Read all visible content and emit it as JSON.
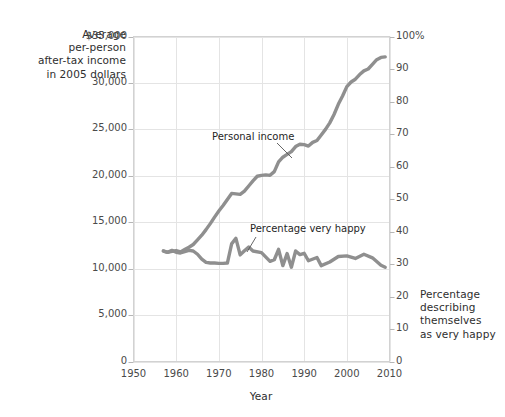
{
  "chart_data": {
    "type": "line",
    "title": "",
    "xlabel": "Year",
    "ylabel_left": "Average per-person after-tax income in 2005 dollars",
    "ylabel_right": "Percentage describing themselves as very happy",
    "xlim": [
      1950,
      2010
    ],
    "ylim_left": [
      0,
      35000
    ],
    "ylim_right": [
      0,
      100
    ],
    "grid": true,
    "legend": "annotations",
    "x_ticks": [
      "1950",
      "1960",
      "1970",
      "1980",
      "1990",
      "2000",
      "2010"
    ],
    "y_ticks_left": [
      "$35,000",
      "30,000",
      "25,000",
      "20,000",
      "15,000",
      "10,000",
      "5,000",
      "0"
    ],
    "y_ticks_right": [
      "100%",
      "90",
      "80",
      "70",
      "60",
      "50",
      "40",
      "30",
      "20",
      "10",
      "0"
    ],
    "series": [
      {
        "name": "Personal income",
        "axis": "left",
        "units": "2005 dollars",
        "color": "#8f8f8f",
        "x": [
          1957,
          1958,
          1959,
          1960,
          1961,
          1962,
          1963,
          1964,
          1965,
          1966,
          1967,
          1968,
          1969,
          1970,
          1971,
          1972,
          1973,
          1974,
          1975,
          1976,
          1977,
          1978,
          1979,
          1980,
          1981,
          1982,
          1983,
          1984,
          1985,
          1986,
          1987,
          1988,
          1989,
          1990,
          1991,
          1992,
          1993,
          1994,
          1995,
          1996,
          1997,
          1998,
          1999,
          2000,
          2001,
          2002,
          2003,
          2004,
          2005,
          2006,
          2007,
          2008,
          2009
        ],
        "values": [
          11900,
          11750,
          11850,
          11950,
          11800,
          12050,
          12300,
          12600,
          13100,
          13600,
          14200,
          14850,
          15550,
          16200,
          16800,
          17450,
          18100,
          18050,
          18000,
          18350,
          18900,
          19450,
          19950,
          20050,
          20100,
          20050,
          20450,
          21500,
          22000,
          22300,
          22600,
          23150,
          23400,
          23350,
          23200,
          23600,
          23800,
          24400,
          25000,
          25700,
          26600,
          27700,
          28600,
          29600,
          30100,
          30400,
          30900,
          31300,
          31500,
          32000,
          32500,
          32750,
          32800
        ]
      },
      {
        "name": "Percentage very happy",
        "axis": "right",
        "units": "percent",
        "color": "#8f8f8f",
        "x": [
          1957,
          1958,
          1959,
          1960,
          1961,
          1962,
          1963,
          1964,
          1965,
          1966,
          1967,
          1968,
          1969,
          1970,
          1971,
          1972,
          1973,
          1974,
          1975,
          1976,
          1977,
          1978,
          1980,
          1982,
          1983,
          1984,
          1985,
          1986,
          1987,
          1988,
          1989,
          1990,
          1991,
          1993,
          1994,
          1996,
          1998,
          2000,
          2002,
          2004,
          2006,
          2008,
          2009
        ],
        "values": [
          34.0,
          33.6,
          34.2,
          33.6,
          33.4,
          33.8,
          34.2,
          34.0,
          33.0,
          31.5,
          30.5,
          30.3,
          30.3,
          30.2,
          30.2,
          30.3,
          36.2,
          37.9,
          32.8,
          34.1,
          35.2,
          34.0,
          33.5,
          30.8,
          31.3,
          34.5,
          29.5,
          33.2,
          29.0,
          34.0,
          32.9,
          33.3,
          31.0,
          32.0,
          29.5,
          30.6,
          32.3,
          32.5,
          31.7,
          33.0,
          31.9,
          29.6,
          29.0
        ]
      }
    ],
    "annotations": [
      {
        "text": "Personal income",
        "x": 1980,
        "y": 22300
      },
      {
        "text": "Percentage very happy",
        "x": 1988,
        "y": 41
      }
    ]
  },
  "axes": {
    "left_title": "Average\nper-person\nafter-tax income\nin 2005 dollars",
    "left_title_lines": [
      "Average",
      "per-person",
      "after-tax income",
      "in 2005 dollars"
    ],
    "right_title_lines": [
      "Percentage",
      "describing",
      "themselves",
      "as very happy"
    ],
    "x_title": "Year"
  },
  "colors": {
    "line": "#8f8f8f",
    "grid": "#e4e4e4",
    "frame": "#d2d2d2",
    "text": "#3b3b3b",
    "annotation_leader": "#555555"
  }
}
